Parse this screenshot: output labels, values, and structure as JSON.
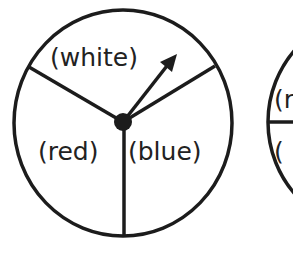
{
  "diagram": {
    "type": "spinner",
    "stroke_color": "#1c1c1c",
    "main_spinner": {
      "sections": [
        {
          "label": "(white)",
          "position": "top"
        },
        {
          "label": "(red)",
          "position": "bottom-left"
        },
        {
          "label": "(blue)",
          "position": "bottom-right"
        }
      ],
      "arrow": "pointing up-right into white section"
    },
    "partial_spinner": {
      "visible_labels": [
        "(r",
        "("
      ]
    }
  }
}
